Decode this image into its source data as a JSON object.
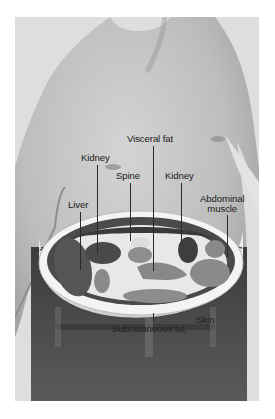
{
  "figure": {
    "labels": {
      "visceral_fat": "Visceral fat",
      "kidney_left": "Kidney",
      "kidney_right": "Kidney",
      "spine": "Spine",
      "liver": "Liver",
      "abdominal_muscle_line1": "Abdominal",
      "abdominal_muscle_line2": "muscle",
      "subcutaneous_fat": "Subcutaneous fat",
      "skin": "Skin"
    },
    "colors": {
      "background": "#ffffff",
      "frame": "#dcdcdc",
      "skin": "#b8b8b8",
      "organ_dark": "#4a4a4a",
      "organ_mid": "#8a8a8a",
      "fat": "#efefef",
      "pants": "#4f4f4f",
      "text": "#1a1a1a"
    }
  }
}
